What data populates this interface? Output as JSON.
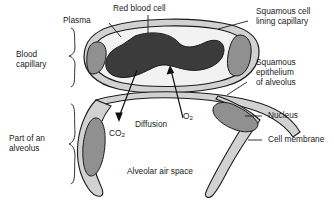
{
  "diagram": {
    "labels": {
      "plasma": "Plasma",
      "red_blood_cell": "Red blood cell",
      "squamous_cell_lining_capillary_l1": "Squamous cell",
      "squamous_cell_lining_capillary_l2": "lining capillary",
      "squamous_epithelium_l1": "Squamous",
      "squamous_epithelium_l2": "epithelium",
      "squamous_epithelium_l3": "of alveolus",
      "nucleus": "Nucleus",
      "cell_membrane": "Cell membrane",
      "blood_capillary_l1": "Blood",
      "blood_capillary_l2": "capillary",
      "part_of_an_alveolus_l1": "Part of an",
      "part_of_an_alveolus_l2": "alveolus",
      "diffusion": "Diffusion",
      "alveolar_air_space": "Alveolar air space",
      "carbon_dioxide_main": "CO",
      "carbon_dioxide_sub": "2",
      "oxygen_main": "O",
      "oxygen_sub": "2"
    },
    "colors": {
      "red_blood_cell": "#3b3b3b",
      "plasma": "#f2f2f2",
      "cytoplasm": "#d2d2d2",
      "nucleus": "#909090",
      "outline": "#1b1b1b",
      "background": "#ffffff",
      "text": "#1b1b1b"
    }
  }
}
